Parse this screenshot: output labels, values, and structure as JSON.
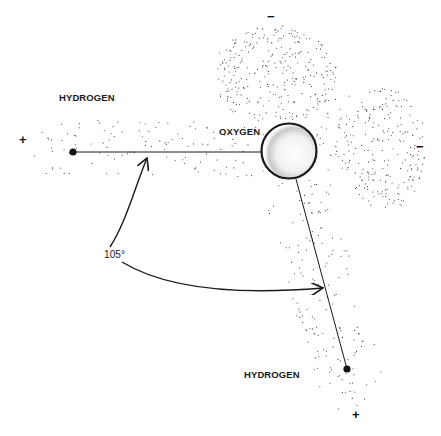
{
  "diagram": {
    "atoms": [
      {
        "label": "HYDROGEN",
        "charge": "+"
      },
      {
        "label": "OXYGEN",
        "charges": [
          "-",
          "-"
        ]
      },
      {
        "label": "HYDROGEN",
        "charge": "+"
      }
    ],
    "bond_angle": "105°",
    "charges": {
      "plus_left": "+",
      "plus_bottom": "+",
      "minus_top": "−",
      "minus_right": "−"
    },
    "colors": {
      "ink": "#1a1a1a",
      "background": "#ffffff",
      "stipple": "#333333"
    }
  }
}
